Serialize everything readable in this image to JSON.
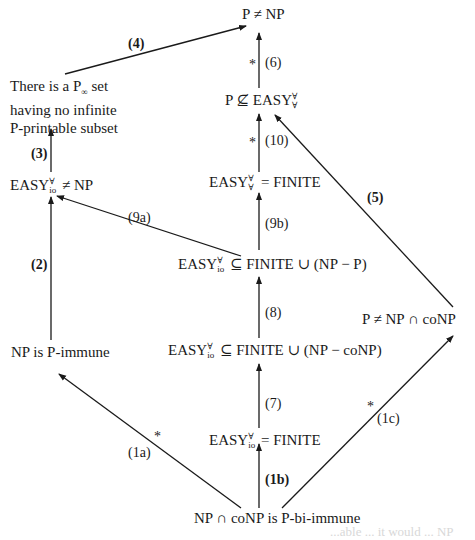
{
  "diagram": {
    "type": "implication-graph",
    "nodes": {
      "p_ne_np": {
        "text": "P ≠ NP"
      },
      "p_nsub_easy": {
        "prefix": "P ⊈ EASY",
        "sup": "∀",
        "sub": "∀"
      },
      "p_inf": {
        "line1_pre": "There is a P",
        "line1_sub": "∞",
        "line1_post": " set",
        "line2": "having no infinite",
        "line3": "P-printable subset"
      },
      "easy_aa_finite": {
        "prefix": "EASY",
        "sup": "∀",
        "sub": "∀",
        "suffix": " = FINITE"
      },
      "easy_io_ne_np": {
        "prefix": "EASY",
        "sup": "∀",
        "sub": "io",
        "suffix": " ≠ NP"
      },
      "easy_io_sub_np_p": {
        "prefix": "EASY",
        "sup": "∀",
        "sub": "io",
        "suffix": " ⊆ FINITE ∪ (NP − P)"
      },
      "p_ne_np_conp": {
        "text": "P ≠ NP ∩ coNP"
      },
      "np_immune": {
        "text": "NP is P-immune"
      },
      "easy_io_sub_np_conp": {
        "prefix": "EASY",
        "sup": "∀",
        "sub": "io",
        "suffix": " ⊆ FINITE ∪ (NP − coNP)"
      },
      "easy_io_finite": {
        "prefix": "EASY",
        "sup": "∀",
        "sub": "io",
        "suffix": " = FINITE"
      },
      "np_conp_biimmune": {
        "text": "NP ∩ coNP is P-bi-immune"
      }
    },
    "edges": [
      {
        "id": "4",
        "label": "(4)",
        "bold": true,
        "star": false,
        "from": "p_inf",
        "to": "p_ne_np"
      },
      {
        "id": "6",
        "label": "(6)",
        "bold": false,
        "star": true,
        "from": "p_nsub_easy",
        "to": "p_ne_np"
      },
      {
        "id": "10",
        "label": "(10)",
        "bold": false,
        "star": true,
        "from": "easy_aa_finite",
        "to": "p_nsub_easy"
      },
      {
        "id": "3",
        "label": "(3)",
        "bold": true,
        "star": false,
        "from": "easy_io_ne_np",
        "to": "p_inf"
      },
      {
        "id": "5",
        "label": "(5)",
        "bold": true,
        "star": false,
        "from": "p_ne_np_conp",
        "to": "p_nsub_easy"
      },
      {
        "id": "9a",
        "label": "(9a)",
        "bold": false,
        "star": false,
        "from": "easy_io_sub_np_p",
        "to": "easy_io_ne_np"
      },
      {
        "id": "9b",
        "label": "(9b)",
        "bold": false,
        "star": false,
        "from": "easy_io_sub_np_p",
        "to": "easy_aa_finite"
      },
      {
        "id": "2",
        "label": "(2)",
        "bold": true,
        "star": false,
        "from": "np_immune",
        "to": "easy_io_ne_np"
      },
      {
        "id": "8",
        "label": "(8)",
        "bold": false,
        "star": false,
        "from": "easy_io_sub_np_conp",
        "to": "easy_io_sub_np_p"
      },
      {
        "id": "7",
        "label": "(7)",
        "bold": false,
        "star": false,
        "from": "easy_io_finite",
        "to": "easy_io_sub_np_conp"
      },
      {
        "id": "1a",
        "label": "(1a)",
        "bold": false,
        "star": true,
        "from": "np_conp_biimmune",
        "to": "np_immune"
      },
      {
        "id": "1b",
        "label": "(1b)",
        "bold": true,
        "star": false,
        "from": "np_conp_biimmune",
        "to": "easy_io_finite"
      },
      {
        "id": "1c",
        "label": "(1c)",
        "bold": false,
        "star": true,
        "from": "np_conp_biimmune",
        "to": "p_ne_np_conp"
      }
    ],
    "star_symbol": "*",
    "faint_fragment": "...able ... it would ... NP"
  }
}
